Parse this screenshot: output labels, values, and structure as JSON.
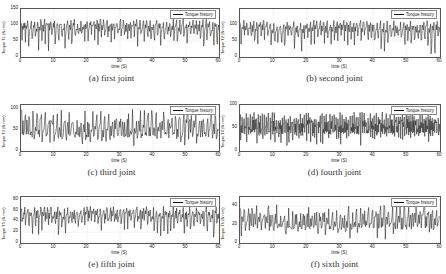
{
  "chart_data": [
    {
      "type": "line",
      "caption": "(a) first joint",
      "title": "",
      "xlabel": "time (S)",
      "ylabel": "Torque T1 (N·mm)",
      "legend": [
        "Torque history"
      ],
      "legend_position": "upper right",
      "grid": true,
      "xlim": [
        0,
        60
      ],
      "ylim": [
        0,
        150
      ],
      "xticks": [
        0,
        10,
        20,
        30,
        40,
        50,
        60
      ],
      "yticks": [
        0,
        50,
        100,
        150
      ],
      "series": [
        {
          "name": "Torque history",
          "mean": 90,
          "min": 12,
          "max": 120,
          "period_s": 1.0
        }
      ]
    },
    {
      "type": "line",
      "caption": "(b) second joint",
      "title": "",
      "xlabel": "time (S)",
      "ylabel": "Torque T2 (N·mm)",
      "legend": [
        "Torque history"
      ],
      "legend_position": "upper right",
      "grid": true,
      "xlim": [
        0,
        60
      ],
      "ylim": [
        0,
        150
      ],
      "xticks": [
        0,
        10,
        20,
        30,
        40,
        50,
        60
      ],
      "yticks": [
        0,
        50,
        100
      ],
      "series": [
        {
          "name": "Torque history",
          "mean": 85,
          "min": 5,
          "max": 115,
          "period_s": 1.0
        }
      ]
    },
    {
      "type": "line",
      "caption": "(c) third joint",
      "title": "",
      "xlabel": "time (S)",
      "ylabel": "Torque T3 (N·mm)",
      "legend": [
        "Torque history"
      ],
      "legend_position": "upper right",
      "grid": true,
      "xlim": [
        0,
        60
      ],
      "ylim": [
        0,
        110
      ],
      "xticks": [
        0,
        10,
        20,
        30,
        40,
        50,
        60
      ],
      "yticks": [
        0,
        50,
        100
      ],
      "series": [
        {
          "name": "Torque history",
          "mean": 50,
          "min": 5,
          "max": 100,
          "period_s": 1.2
        }
      ]
    },
    {
      "type": "line",
      "caption": "(d) fourth joint",
      "title": "",
      "xlabel": "time (S)",
      "ylabel": "Torque T4 (N·mm)",
      "legend": [
        "Torque history"
      ],
      "legend_position": "upper right",
      "grid": true,
      "xlim": [
        0,
        60
      ],
      "ylim": [
        0,
        100
      ],
      "xticks": [
        0,
        10,
        20,
        30,
        40,
        50,
        60
      ],
      "yticks": [
        0,
        50,
        100
      ],
      "series": [
        {
          "name": "Torque history",
          "mean": 50,
          "min": 10,
          "max": 85,
          "period_s": 0.6
        }
      ]
    },
    {
      "type": "line",
      "caption": "(e) fifth joint",
      "title": "",
      "xlabel": "time (S)",
      "ylabel": "Torque T5 (N·mm)",
      "legend": [
        "Torque history"
      ],
      "legend_position": "upper right",
      "grid": true,
      "xlim": [
        0,
        60
      ],
      "ylim": [
        0,
        85
      ],
      "xticks": [
        0,
        10,
        20,
        30,
        40,
        50,
        60
      ],
      "yticks": [
        0,
        20,
        40,
        60,
        80
      ],
      "series": [
        {
          "name": "Torque history",
          "mean": 50,
          "min": 10,
          "max": 68,
          "period_s": 1.0
        }
      ]
    },
    {
      "type": "line",
      "caption": "(f) sixth joint",
      "title": "",
      "xlabel": "time (S)",
      "ylabel": "Torque T6 (N·mm)",
      "legend": [
        "Torque history"
      ],
      "legend_position": "upper right",
      "grid": true,
      "xlim": [
        0,
        60
      ],
      "ylim": [
        0,
        50
      ],
      "xticks": [
        0,
        10,
        20,
        30,
        40,
        50,
        60
      ],
      "yticks": [
        0,
        20,
        40
      ],
      "series": [
        {
          "name": "Torque history",
          "mean": 22,
          "min": 3,
          "max": 42,
          "period_s": 1.2
        }
      ]
    }
  ]
}
